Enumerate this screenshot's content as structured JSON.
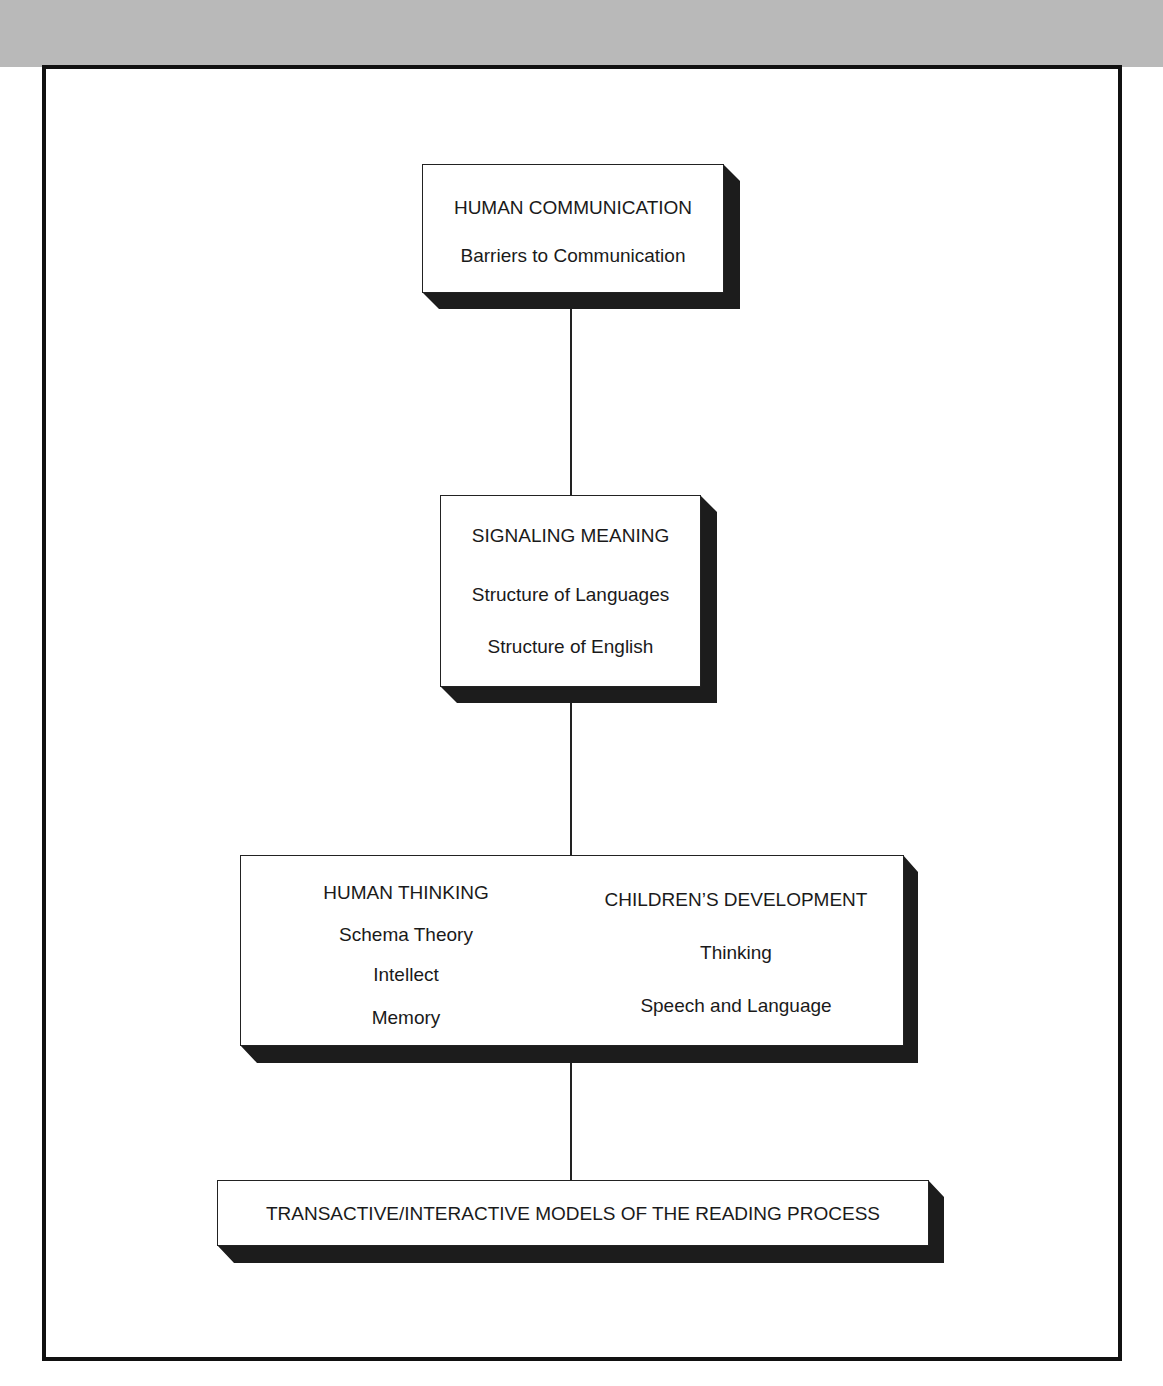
{
  "diagram": {
    "type": "hierarchy-flow",
    "boxes": [
      {
        "id": "human-communication",
        "title": "HUMAN COMMUNICATION",
        "items": [
          "Barriers to Communication"
        ]
      },
      {
        "id": "signaling-meaning",
        "title": "SIGNALING MEANING",
        "items": [
          "Structure of Languages",
          "Structure of English"
        ]
      },
      {
        "id": "thinking-development",
        "columns": [
          {
            "title": "HUMAN THINKING",
            "items": [
              "Schema Theory",
              "Intellect",
              "Memory"
            ]
          },
          {
            "title": "CHILDREN’S DEVELOPMENT",
            "items": [
              "Thinking",
              "Speech and Language"
            ]
          }
        ]
      },
      {
        "id": "reading-models",
        "title": "TRANSACTIVE/INTERACTIVE MODELS OF THE READING PROCESS",
        "items": []
      }
    ],
    "connections": [
      [
        "human-communication",
        "signaling-meaning"
      ],
      [
        "signaling-meaning",
        "thinking-development"
      ],
      [
        "thinking-development",
        "reading-models"
      ]
    ],
    "colors": {
      "band": "#b9b9b9",
      "frame": "#111111",
      "shadow": "#1c1c1c",
      "box_fill": "#ffffff"
    }
  }
}
